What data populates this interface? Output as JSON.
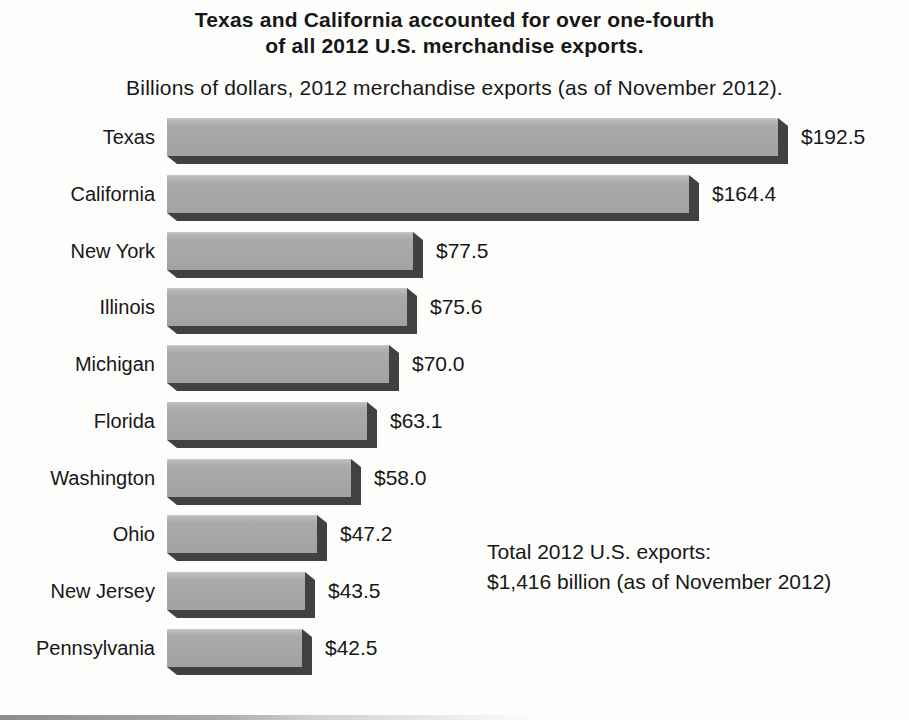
{
  "page": {
    "background": "#fdfdfc"
  },
  "chart_data": {
    "type": "bar",
    "orientation": "horizontal",
    "title_line1": "Texas and California accounted for over one-fourth",
    "title_line2": "of all 2012 U.S. merchandise exports.",
    "subtitle": "Billions of dollars, 2012 merchandise exports (as of November 2012).",
    "categories": [
      "Texas",
      "California",
      "New York",
      "Illinois",
      "Michigan",
      "Florida",
      "Washington",
      "Ohio",
      "New Jersey",
      "Pennsylvania"
    ],
    "values": [
      192.5,
      164.4,
      77.5,
      75.6,
      70.0,
      63.1,
      58.0,
      47.2,
      43.5,
      42.5
    ],
    "value_labels": [
      "$192.5",
      "$164.4",
      "$77.5",
      "$75.6",
      "$70.0",
      "$63.1",
      "$58.0",
      "$47.2",
      "$43.5",
      "$42.5"
    ],
    "annotation_line1": "Total 2012 U.S. exports:",
    "annotation_line2": "$1,416 billion (as of November 2012)",
    "xlim": [
      0,
      200
    ],
    "grid": false,
    "legend": "none",
    "bar_color": "#a6a6a6",
    "bar_shadow_color": "#414141",
    "text_color": "#171717"
  }
}
